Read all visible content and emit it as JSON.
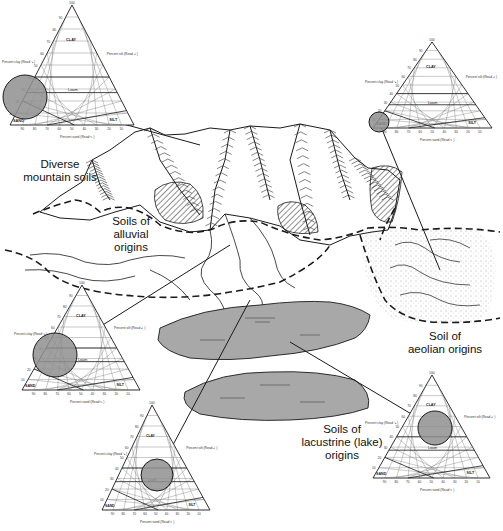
{
  "colors": {
    "ink": "#1a1a1a",
    "lake": "#a8a8a8",
    "circle": "#8f8f8f",
    "background": "#ffffff"
  },
  "regions": [
    {
      "id": "mountain",
      "label": "Diverse\nmountain soils",
      "pos": [
        10,
        158,
        100
      ]
    },
    {
      "id": "alluvial",
      "label": "Soils of\nalluvial\norigins",
      "pos": [
        95,
        215,
        72
      ]
    },
    {
      "id": "aeolian",
      "label": "Soil of\naeolian origins",
      "pos": [
        400,
        330,
        90
      ]
    },
    {
      "id": "lacustrine",
      "label": "Soils of\nlacustrine (lake)\norigins",
      "pos": [
        282,
        423,
        120
      ]
    }
  ],
  "triangle_labels": {
    "apex_value": "100",
    "ticks": [
      "10",
      "20",
      "30",
      "40",
      "50",
      "60",
      "70",
      "80",
      "90"
    ],
    "left_axis": "Percent clay (Read ↘)",
    "right_axis": "Percent silt (Read ↙)",
    "bottom_axis": "Percent sand (Read ↖)",
    "classes": [
      "CLAY",
      "Silty clay",
      "Sandy clay",
      "Clay loam",
      "Silty clay loam",
      "Sandy clay loam",
      "Loam",
      "Silt loam",
      "Sandy loam",
      "Loamy sand",
      "SAND",
      "SILT"
    ]
  },
  "triangles": [
    {
      "id": "t1",
      "apex": [
        72,
        5
      ],
      "left": [
        10,
        125
      ],
      "right": [
        134,
        125
      ],
      "circle": [
        25,
        97,
        22
      ],
      "callout_to": [
        200,
        145
      ]
    },
    {
      "id": "t2",
      "apex": [
        432,
        42
      ],
      "left": [
        373,
        128
      ],
      "right": [
        492,
        128
      ],
      "circle": [
        379,
        122,
        10
      ],
      "callout_to": [
        440,
        270
      ]
    },
    {
      "id": "t3",
      "apex": [
        82,
        285
      ],
      "left": [
        22,
        390
      ],
      "right": [
        140,
        390
      ],
      "circle": [
        55,
        355,
        22
      ],
      "callout_to": [
        230,
        245
      ]
    },
    {
      "id": "t4",
      "apex": [
        152,
        405
      ],
      "left": [
        102,
        510
      ],
      "right": [
        210,
        510
      ],
      "circle": [
        157,
        475,
        16
      ],
      "callout_to": [
        250,
        300
      ]
    },
    {
      "id": "t5",
      "apex": [
        432,
        375
      ],
      "left": [
        373,
        478
      ],
      "right": [
        490,
        478
      ],
      "circle": [
        435,
        428,
        17
      ],
      "callout_to": [
        290,
        342
      ]
    }
  ]
}
